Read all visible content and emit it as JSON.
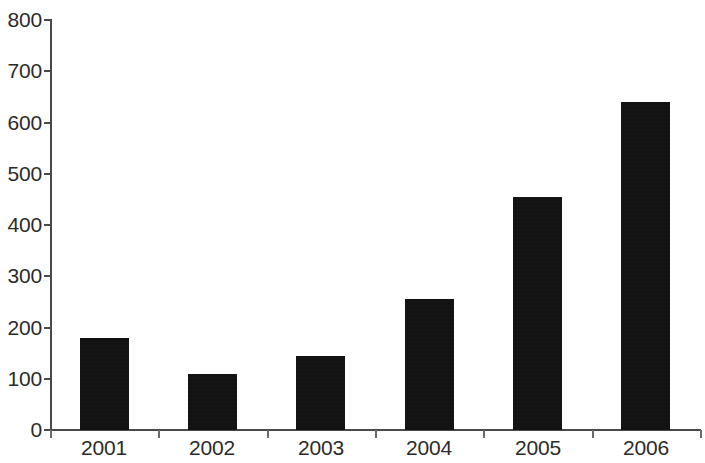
{
  "chart_data": {
    "type": "bar",
    "title": "",
    "subtitle": "",
    "xlabel": "",
    "ylabel": "",
    "categories": [
      "2001",
      "2002",
      "2003",
      "2004",
      "2005",
      "2006"
    ],
    "values": [
      180,
      110,
      145,
      255,
      455,
      640
    ],
    "series": [
      {
        "name": "",
        "values": [
          180,
          110,
          145,
          255,
          455,
          640
        ]
      }
    ],
    "ylim": [
      0,
      800
    ],
    "yticks": [
      0,
      100,
      200,
      300,
      400,
      500,
      600,
      700,
      800
    ],
    "ytick_labels": [
      "0",
      "100",
      "200",
      "300",
      "400",
      "500",
      "600",
      "700",
      "800"
    ],
    "grid": false,
    "legend": false,
    "legend_position": "none",
    "bar_color": "#111111",
    "axis_color": "#4a4a4a",
    "background_color": "#ffffff",
    "annotations": []
  }
}
